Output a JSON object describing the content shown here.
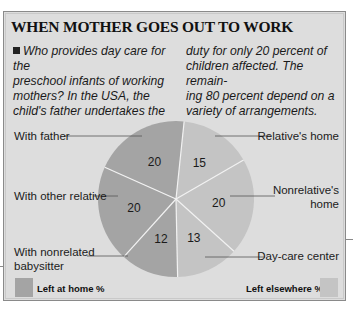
{
  "title": "WHEN MOTHER GOES OUT TO WORK",
  "intro": {
    "col1_lines": [
      "Who provides day care for the",
      "preschool infants of working",
      "mothers? In the USA, the",
      "child's father undertakes the"
    ],
    "col2_lines": [
      "duty for only 20 percent of",
      "children affected. The remain-",
      "ing 80 percent depend on a",
      "variety of arrangements."
    ]
  },
  "colors": {
    "background": "#dddddd",
    "left_at_home": "#a4a4a4",
    "left_elsewhere": "#c4c4c4",
    "divider": "#f2f2f2"
  },
  "chart_data": {
    "type": "pie",
    "title": "WHEN MOTHER GOES OUT TO WORK",
    "start": "top",
    "direction": "clockwise",
    "slices": [
      {
        "label": "Relative's home",
        "value": 15,
        "group": "Left elsewhere %"
      },
      {
        "label": "Nonrelative's home",
        "value": 20,
        "group": "Left elsewhere %"
      },
      {
        "label": "Day-care center",
        "value": 13,
        "group": "Left elsewhere %"
      },
      {
        "label": "With nonrelated babysitter",
        "value": 12,
        "group": "Left at home %"
      },
      {
        "label": "With other relative",
        "value": 20,
        "group": "Left at home %"
      },
      {
        "label": "With father",
        "value": 20,
        "group": "Left at home %"
      }
    ],
    "legend": [
      {
        "label": "Left at home %",
        "placement": "bottom-left"
      },
      {
        "label": "Left elsewhere %",
        "placement": "bottom-right"
      }
    ],
    "units": "percent"
  },
  "labels": {
    "with_father": "With father",
    "with_other_relative": "With other relative",
    "with_nonrelated_1": "With nonrelated",
    "with_nonrelated_2": "babysitter",
    "relatives_home": "Relative's home",
    "nonrelatives_home_1": "Nonrelative's",
    "nonrelatives_home_2": "home",
    "day_care": "Day-care center"
  },
  "legend": {
    "left_at_home": "Left at home %",
    "left_elsewhere": "Left elsewhere %"
  }
}
